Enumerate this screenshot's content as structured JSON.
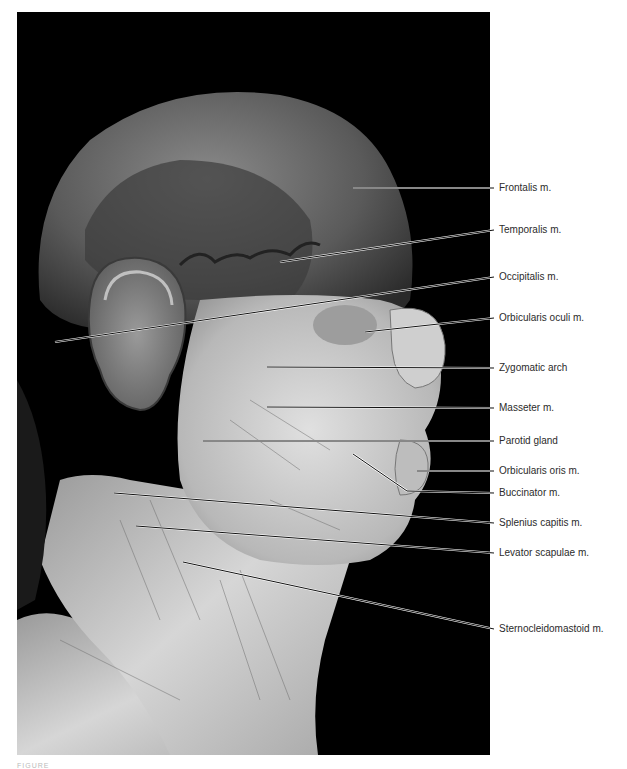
{
  "figure": {
    "photo_description": "Lateral view of a dissected human head and neck showing superficial muscles of facial expression and neck",
    "background_color": "#000000",
    "page_color": "#ffffff",
    "label_color": "#2b2b2b",
    "caption_text": "FIGURE"
  },
  "labels": [
    {
      "text": "Frontalis m.",
      "x": 497,
      "y": 188,
      "from": [
        353,
        188
      ]
    },
    {
      "text": "Temporalis m.",
      "x": 497,
      "y": 230,
      "from": [
        280,
        262
      ]
    },
    {
      "text": "Occipitalis m.",
      "x": 497,
      "y": 277,
      "from": [
        55,
        342
      ]
    },
    {
      "text": "Orbicularis oculi m.",
      "x": 497,
      "y": 318,
      "from": [
        365,
        332
      ]
    },
    {
      "text": "Zygomatic arch",
      "x": 497,
      "y": 368,
      "from": [
        267,
        367
      ]
    },
    {
      "text": "Masseter m.",
      "x": 497,
      "y": 408,
      "from": [
        267,
        407
      ]
    },
    {
      "text": "Parotid gland",
      "x": 497,
      "y": 441,
      "from": [
        203,
        441
      ]
    },
    {
      "text": "Orbicularis oris m.",
      "x": 497,
      "y": 471,
      "from": [
        417,
        471
      ]
    },
    {
      "text": "Buccinator m.",
      "x": 497,
      "y": 493,
      "from": [
        353,
        454
      ],
      "bend": [
        407,
        491
      ]
    },
    {
      "text": "Splenius capitis m.",
      "x": 497,
      "y": 523,
      "from": [
        114,
        493
      ]
    },
    {
      "text": "Levator scapulae m.",
      "x": 497,
      "y": 553,
      "from": [
        136,
        526
      ]
    },
    {
      "text": "Sternocleidomastoid m.",
      "x": 497,
      "y": 629,
      "from": [
        183,
        562
      ]
    }
  ]
}
